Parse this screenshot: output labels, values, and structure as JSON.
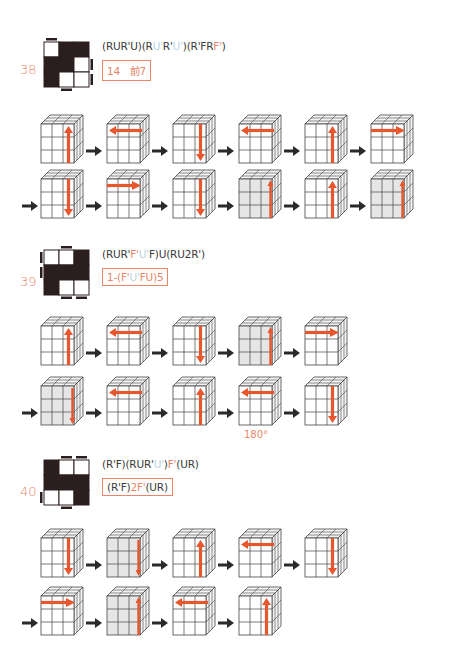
{
  "colors": {
    "accent": "#e8866a",
    "blue": "#b9d3e6",
    "text": "#3a3a3a",
    "arrow": "#2a2a2a",
    "move": "#e8562e"
  },
  "sections": [
    {
      "number": "38",
      "pattern": [
        [
          "W",
          "B",
          "B"
        ],
        [
          "B",
          "B",
          "W"
        ],
        [
          "B",
          "W",
          "W"
        ]
      ],
      "bars": {
        "top": [
          0
        ],
        "right": [
          1,
          2
        ],
        "bottom": [
          1
        ],
        "left": []
      },
      "formula": [
        [
          "k",
          "(RUR'U)(R"
        ],
        [
          "b",
          "U'"
        ],
        [
          "k",
          "R'"
        ],
        [
          "b",
          "U'"
        ],
        [
          "k",
          ")(R'FR"
        ],
        [
          "o",
          "F'"
        ],
        [
          "k",
          ")"
        ]
      ],
      "box": [
        [
          "o",
          "14　前7"
        ]
      ],
      "rows": [
        {
          "lead_arrow": false,
          "cubes": [
            {
              "shade": "none",
              "arrow": "up-right"
            },
            {
              "shade": "none",
              "arrow": "left-top"
            },
            {
              "shade": "none",
              "arrow": "down-right"
            },
            {
              "shade": "none",
              "arrow": "left-top"
            },
            {
              "shade": "none",
              "arrow": "up-right"
            },
            {
              "shade": "none",
              "arrow": "right-top"
            }
          ]
        },
        {
          "lead_arrow": true,
          "cubes": [
            {
              "shade": "none",
              "arrow": "down-right"
            },
            {
              "shade": "none",
              "arrow": "right-top"
            },
            {
              "shade": "none",
              "arrow": "down-right"
            },
            {
              "shade": "front",
              "arrow": "up-edge"
            },
            {
              "shade": "none",
              "arrow": "up-right"
            },
            {
              "shade": "front",
              "arrow": "up-edge"
            }
          ]
        }
      ]
    },
    {
      "number": "39",
      "pattern": [
        [
          "W",
          "W",
          "B"
        ],
        [
          "B",
          "B",
          "B"
        ],
        [
          "B",
          "W",
          "W"
        ]
      ],
      "bars": {
        "top": [
          1
        ],
        "right": [],
        "bottom": [
          1,
          2
        ],
        "left": [
          0,
          1
        ]
      },
      "formula": [
        [
          "k",
          "(RUR'"
        ],
        [
          "o",
          "F'"
        ],
        [
          "b",
          "U'"
        ],
        [
          "k",
          "F)U(RU2R')"
        ]
      ],
      "box": [
        [
          "o",
          "1-(F'"
        ],
        [
          "b",
          "U'"
        ],
        [
          "o",
          "FU)5"
        ]
      ],
      "rows": [
        {
          "lead_arrow": false,
          "cubes": [
            {
              "shade": "none",
              "arrow": "up-right"
            },
            {
              "shade": "none",
              "arrow": "left-top"
            },
            {
              "shade": "none",
              "arrow": "down-right"
            },
            {
              "shade": "front",
              "arrow": "up-edge"
            },
            {
              "shade": "none",
              "arrow": "right-top"
            }
          ]
        },
        {
          "lead_arrow": true,
          "cubes": [
            {
              "shade": "front",
              "arrow": "down-edge"
            },
            {
              "shade": "none",
              "arrow": "left-top"
            },
            {
              "shade": "none",
              "arrow": "up-right"
            },
            {
              "shade": "none",
              "arrow": "left-top",
              "label": "180°"
            },
            {
              "shade": "none",
              "arrow": "down-right"
            }
          ]
        }
      ]
    },
    {
      "number": "40",
      "pattern": [
        [
          "B",
          "W",
          "W"
        ],
        [
          "B",
          "B",
          "B"
        ],
        [
          "W",
          "W",
          "B"
        ]
      ],
      "bars": {
        "top": [
          1,
          2
        ],
        "right": [],
        "bottom": [
          1
        ],
        "left": [
          2
        ]
      },
      "formula": [
        [
          "k",
          "(R'F)(RUR'"
        ],
        [
          "b",
          "U'"
        ],
        [
          "k",
          ")"
        ],
        [
          "o",
          "F'"
        ],
        [
          "k",
          "(UR)"
        ]
      ],
      "box": [
        [
          "k",
          "(R'F)"
        ],
        [
          "o",
          "2F'"
        ],
        [
          "k",
          "(UR)"
        ]
      ],
      "rows": [
        {
          "lead_arrow": false,
          "cubes": [
            {
              "shade": "none",
              "arrow": "down-right"
            },
            {
              "shade": "front",
              "arrow": "down-edge"
            },
            {
              "shade": "none",
              "arrow": "up-right"
            },
            {
              "shade": "none",
              "arrow": "left-top"
            },
            {
              "shade": "none",
              "arrow": "down-right"
            }
          ]
        },
        {
          "lead_arrow": true,
          "cubes": [
            {
              "shade": "none",
              "arrow": "right-top"
            },
            {
              "shade": "front",
              "arrow": "up-edge"
            },
            {
              "shade": "none",
              "arrow": "left-top"
            },
            {
              "shade": "none",
              "arrow": "up-right"
            }
          ]
        }
      ]
    }
  ]
}
